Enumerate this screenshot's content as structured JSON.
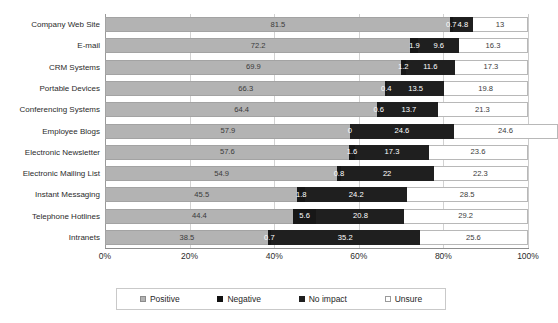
{
  "chart_data": {
    "type": "bar",
    "orientation": "horizontal",
    "stacked": true,
    "stack_mode": "percent",
    "title": "ELECTRONIC COMMUNICATION IMPACT ON BUSINESS",
    "xlabel": "",
    "ylabel": "",
    "xlim": [
      0,
      100
    ],
    "xticks": [
      "0%",
      "20%",
      "40%",
      "60%",
      "80%",
      "100%"
    ],
    "xtick_values": [
      0,
      20,
      40,
      60,
      80,
      100
    ],
    "grid": true,
    "legend_position": "bottom",
    "categories": [
      "Company Web Site",
      "E-mail",
      "CRM Systems",
      "Portable Devices",
      "Conferencing Systems",
      "Employee Blogs",
      "Electronic Newsletter",
      "Electronic Mailing List",
      "Instant Messaging",
      "Telephone Hotlines",
      "Intranets"
    ],
    "series": [
      {
        "name": "Positive",
        "color": "#b3b3b3",
        "values": [
          81.5,
          72.2,
          69.9,
          66.3,
          64.4,
          57.9,
          57.6,
          54.9,
          45.5,
          44.4,
          38.5
        ]
      },
      {
        "name": "Negative",
        "color": "#171717",
        "values": [
          0.7,
          1.9,
          1.2,
          0.4,
          0.6,
          0,
          1.6,
          0.8,
          1.8,
          5.6,
          0.7
        ]
      },
      {
        "name": "No impact",
        "color": "#1f1f1f",
        "values": [
          4.8,
          9.6,
          11.6,
          13.5,
          13.7,
          24.6,
          17.3,
          22,
          24.2,
          20.8,
          35.2
        ]
      },
      {
        "name": "Unsure",
        "color": "#ffffff",
        "values": [
          13,
          16.3,
          17.3,
          19.8,
          21.3,
          24.6,
          23.6,
          22.3,
          28.5,
          29.2,
          25.6
        ]
      }
    ]
  }
}
